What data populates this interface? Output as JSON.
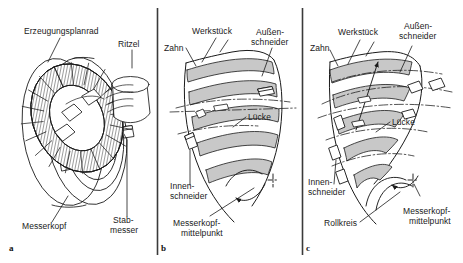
{
  "figure": {
    "width": 463,
    "height": 263,
    "background": "#ffffff",
    "line_color": "#1a1a1a",
    "band_fill": "#c8c8c8",
    "band_fill_light": "#d9d9d9"
  },
  "panels": [
    {
      "id": "a",
      "letter": "a",
      "labels": {
        "erzeugungsplanrad": "Erzeugungsplanrad",
        "ritzel": "Ritzel",
        "messerkopf": "Messerkopf",
        "stabmesser_line1": "Stab-",
        "stabmesser_line2": "messer"
      }
    },
    {
      "id": "b",
      "letter": "b",
      "labels": {
        "werkstueck": "Werkstück",
        "zahn": "Zahn",
        "aussenschneider_line1": "Außen-",
        "aussenschneider_line2": "schneider",
        "luecke": "Lücke",
        "innenschneider_line1": "Innen-",
        "innenschneider_line2": "schneider",
        "messerkopfmittelpunkt_line1": "Messerkopf-",
        "messerkopfmittelpunkt_line2": "mittelpunkt"
      }
    },
    {
      "id": "c",
      "letter": "c",
      "labels": {
        "werkstueck": "Werkstück",
        "zahn": "Zahn",
        "aussenschneider_line1": "Außen-",
        "aussenschneider_line2": "schneider",
        "luecke": "Lücke",
        "innenschneider_line1": "Innen-",
        "innenschneider_line2": "schneider",
        "rollkreis": "Rollkreis",
        "messerkopfmittelpunkt_line1": "Messerkopf-",
        "messerkopfmittelpunkt_line2": "mittelpunkt"
      }
    }
  ]
}
